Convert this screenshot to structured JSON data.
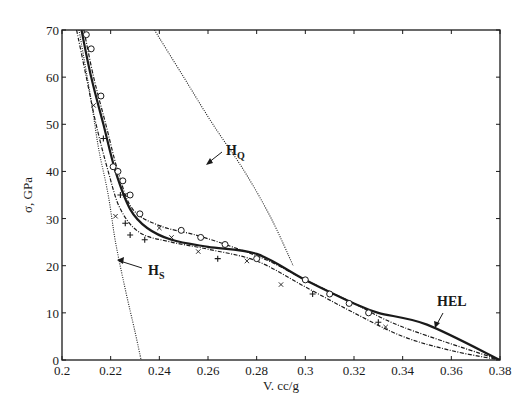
{
  "chart_data": {
    "type": "line",
    "title": "",
    "xlabel": "V. cc/g",
    "ylabel": "σ, GPa",
    "xlim": [
      0.2,
      0.38
    ],
    "ylim": [
      0,
      70
    ],
    "x_ticks": [
      "0.2",
      "0.22",
      "0.24",
      "0.26",
      "0.28",
      "0.3",
      "0.32",
      "0.34",
      "0.36",
      "0.38"
    ],
    "y_ticks": [
      "0",
      "10",
      "20",
      "30",
      "40",
      "50",
      "60",
      "70"
    ],
    "grid": false,
    "legend": null,
    "annotations": [
      {
        "label": "H",
        "sub": "Q",
        "points_to": [
          0.287,
          30
        ]
      },
      {
        "label": "H",
        "sub": "S",
        "points_to": [
          0.222,
          25
        ]
      },
      {
        "label": "HEL",
        "points_to": [
          0.352,
          7.5
        ]
      }
    ],
    "series": [
      {
        "name": "HEL (thick solid fit)",
        "style": "solid-thick",
        "x": [
          0.208,
          0.212,
          0.217,
          0.222,
          0.228,
          0.235,
          0.245,
          0.26,
          0.28,
          0.3,
          0.32,
          0.33,
          0.35,
          0.38
        ],
        "y": [
          70,
          60,
          50,
          40,
          32,
          28,
          25.5,
          24,
          22.5,
          17,
          12,
          10,
          7.5,
          0
        ]
      },
      {
        "name": "Upper dash-dot fit (circles)",
        "style": "dash-dot",
        "x": [
          0.209,
          0.213,
          0.218,
          0.223,
          0.229,
          0.24,
          0.255,
          0.27,
          0.285,
          0.3,
          0.32,
          0.34,
          0.38
        ],
        "y": [
          70,
          60,
          50,
          40,
          32,
          28.5,
          26.5,
          24,
          21,
          17,
          12,
          7,
          0
        ]
      },
      {
        "name": "Lower dash-dot fit (plus/cross)",
        "style": "dash-dot",
        "x": [
          0.206,
          0.21,
          0.214,
          0.219,
          0.224,
          0.232,
          0.245,
          0.26,
          0.28,
          0.3,
          0.32,
          0.34,
          0.36,
          0.38
        ],
        "y": [
          70,
          60,
          50,
          40,
          32,
          27,
          25,
          23.5,
          21,
          15.5,
          10,
          5,
          2,
          0
        ]
      },
      {
        "name": "H_S",
        "style": "dotted",
        "x": [
          0.207,
          0.212,
          0.215,
          0.219,
          0.222,
          0.226,
          0.23,
          0.2325
        ],
        "y": [
          70,
          55,
          45,
          35,
          25,
          15,
          6,
          0
        ]
      },
      {
        "name": "H_Q",
        "style": "dotted",
        "x": [
          0.238,
          0.25,
          0.262,
          0.275,
          0.286,
          0.295
        ],
        "y": [
          70,
          60,
          50,
          40,
          30,
          20
        ]
      },
      {
        "name": "Data (circles)",
        "style": "marker-circle",
        "x": [
          0.21,
          0.212,
          0.216,
          0.221,
          0.223,
          0.225,
          0.228,
          0.232,
          0.249,
          0.257,
          0.267,
          0.28,
          0.3,
          0.31,
          0.318,
          0.326
        ],
        "y": [
          69,
          66,
          56,
          41,
          40,
          38,
          35,
          31,
          27.5,
          26,
          24.5,
          21.5,
          17,
          14,
          12,
          10
        ]
      },
      {
        "name": "Data (plus)",
        "style": "marker-plus",
        "x": [
          0.217,
          0.224,
          0.226,
          0.228,
          0.234,
          0.264,
          0.303,
          0.33
        ],
        "y": [
          47,
          35,
          29,
          26.5,
          25.5,
          21.5,
          14,
          8
        ]
      },
      {
        "name": "Data (cross)",
        "style": "marker-x",
        "x": [
          0.213,
          0.222,
          0.226,
          0.24,
          0.245,
          0.256,
          0.276,
          0.29,
          0.333
        ],
        "y": [
          54,
          30.5,
          35,
          28,
          26,
          23,
          21,
          16,
          7
        ]
      }
    ]
  },
  "labels": {
    "xlabel": "V. cc/g",
    "ylabel": "σ, GPa",
    "hq_main": "H",
    "hq_sub": "Q",
    "hs_main": "H",
    "hs_sub": "S",
    "hel": "HEL"
  },
  "colors": {
    "ink": "#1a1a1a",
    "background": "#ffffff"
  }
}
